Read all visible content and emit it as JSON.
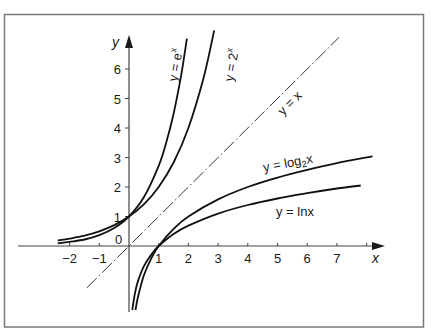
{
  "chart_data": {
    "type": "line",
    "title": "",
    "xlabel": "x",
    "ylabel": "y",
    "xlim": [
      -2.5,
      8.5
    ],
    "ylim": [
      -2.2,
      7.2
    ],
    "grid": false,
    "x_ticks": [
      -2,
      -1,
      1,
      2,
      3,
      4,
      5,
      6,
      7
    ],
    "x_tick_labels": [
      "−2",
      "−1",
      "1",
      "2",
      "3",
      "4",
      "5",
      "6",
      "7"
    ],
    "y_ticks": [
      1,
      2,
      3,
      4,
      5,
      6
    ],
    "y_tick_labels": [
      "1",
      "2",
      "3",
      "4",
      "5",
      "6"
    ],
    "origin_label": "0",
    "series": [
      {
        "name": "y = e^x",
        "label_main": "y = e",
        "label_sup": "x",
        "style": "solid",
        "x": [
          -2.4,
          -2,
          -1.5,
          -1,
          -0.5,
          0,
          0.5,
          1,
          1.25,
          1.5,
          1.75,
          1.95
        ],
        "y": [
          0.09,
          0.14,
          0.22,
          0.37,
          0.61,
          1.0,
          1.65,
          2.72,
          3.49,
          4.48,
          5.75,
          7.03
        ]
      },
      {
        "name": "y = 2^x",
        "label_main": "y = 2",
        "label_sup": "x",
        "style": "solid",
        "x": [
          -2.4,
          -2,
          -1.5,
          -1,
          -0.5,
          0,
          0.5,
          1,
          1.5,
          2,
          2.5,
          2.87
        ],
        "y": [
          0.19,
          0.25,
          0.35,
          0.5,
          0.71,
          1.0,
          1.41,
          2.0,
          2.83,
          4.0,
          5.66,
          7.31
        ]
      },
      {
        "name": "y = x",
        "label_main": "y = x",
        "style": "dash-dot",
        "x": [
          -1.42,
          7.07
        ],
        "y": [
          -1.42,
          7.07
        ]
      },
      {
        "name": "y = log2 x",
        "label_main": "y = log",
        "label_sub": "2",
        "label_tail": "x",
        "style": "solid",
        "x": [
          0.22,
          0.3,
          0.5,
          0.75,
          1,
          1.5,
          2,
          3,
          4,
          5,
          6,
          7,
          8.2
        ],
        "y": [
          -2.17,
          -1.74,
          -1.0,
          -0.42,
          0,
          0.58,
          1.0,
          1.58,
          2.0,
          2.32,
          2.58,
          2.81,
          3.04
        ]
      },
      {
        "name": "y = ln x",
        "label_main": "y = lnx",
        "style": "solid",
        "x": [
          0.11,
          0.2,
          0.3,
          0.5,
          0.75,
          1,
          1.5,
          2,
          3,
          4,
          5,
          6,
          7,
          7.8
        ],
        "y": [
          -2.17,
          -1.61,
          -1.2,
          -0.69,
          -0.29,
          0,
          0.41,
          0.69,
          1.1,
          1.39,
          1.61,
          1.79,
          1.95,
          2.05
        ]
      }
    ]
  },
  "colors": {
    "frame": "#7a7a7a",
    "ink": "#1a1a1a",
    "axis": "#444444",
    "background": "#ffffff"
  }
}
